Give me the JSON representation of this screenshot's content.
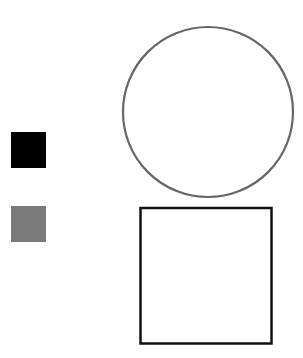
{
  "swatches": [
    {
      "name": "black",
      "color": "#000000"
    },
    {
      "name": "gray",
      "color": "#7a7a7a"
    }
  ],
  "shapes": {
    "circle": {
      "stroke": "#666666",
      "fill": "#ffffff"
    },
    "square": {
      "stroke": "#111111",
      "fill": "#ffffff"
    }
  }
}
